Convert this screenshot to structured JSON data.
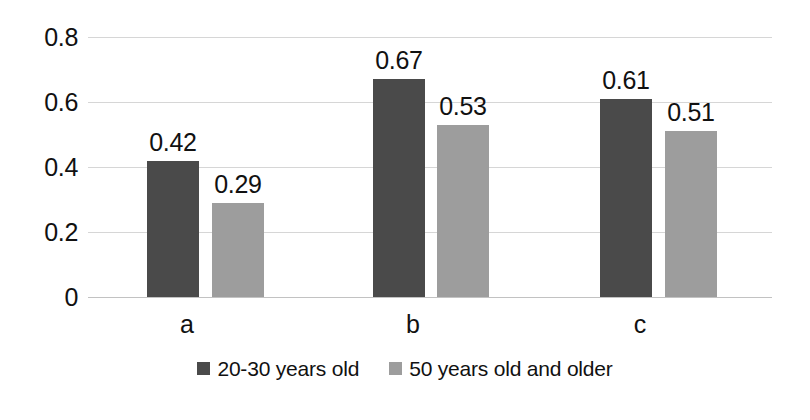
{
  "chart_data": {
    "type": "bar",
    "title": "",
    "subtitle": "",
    "xlabel": "",
    "ylabel": "",
    "categories": [
      "a",
      "b",
      "c"
    ],
    "series": [
      {
        "name": "20-30 years old",
        "color": "#4a4a4a",
        "values": [
          0.42,
          0.67,
          0.61
        ]
      },
      {
        "name": "50 years old and older",
        "color": "#9d9d9d",
        "values": [
          0.29,
          0.53,
          0.51
        ]
      }
    ],
    "data_labels": [
      [
        "0.42",
        "0.67",
        "0.61"
      ],
      [
        "0.29",
        "0.53",
        "0.51"
      ]
    ],
    "ylim": [
      0,
      0.8
    ],
    "yticks": [
      0.8,
      0.6,
      0.4,
      0.2,
      0
    ],
    "ytick_labels": [
      "0.8",
      "0.6",
      "0.4",
      "0.2",
      "0"
    ],
    "grid": "horizontal",
    "grid_color": "#d6d6d6",
    "legend_position": "bottom",
    "background": "#ffffff",
    "show_data_labels": true
  }
}
